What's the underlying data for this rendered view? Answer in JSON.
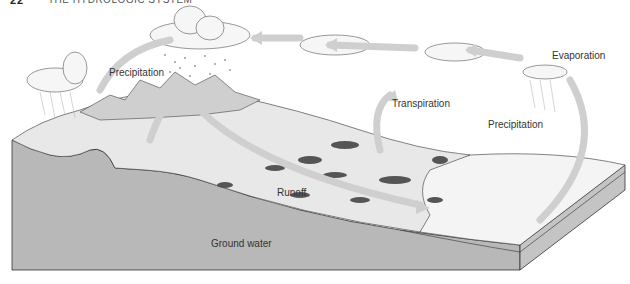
{
  "header": {
    "page_number": "22",
    "running_title": "THE HYDROLOGIC SYSTEM"
  },
  "diagram": {
    "labels": {
      "precipitation_left": "Precipitation",
      "evaporation": "Evaporation",
      "precipitation_right": "Precipitation",
      "transpiration": "Transpiration",
      "runoff": "Runoff",
      "ground_water": "Ground water"
    },
    "colors": {
      "arrow": "#c8c8c8",
      "ground": "#b4b4b4",
      "surface": "#ececec",
      "ocean": "#f2f2f2",
      "outline": "#333333"
    }
  }
}
